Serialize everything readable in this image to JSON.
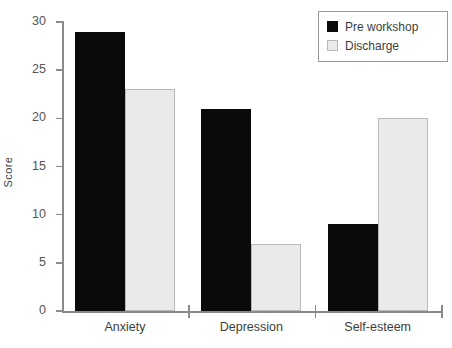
{
  "chart_data": {
    "type": "bar",
    "title": "",
    "xlabel": "",
    "ylabel": "Score",
    "categories": [
      "Anxiety",
      "Depression",
      "Self-esteem"
    ],
    "series": [
      {
        "name": "Pre workshop",
        "color": "#0a0a0a",
        "values": [
          29,
          21,
          9
        ]
      },
      {
        "name": "Discharge",
        "color": "#eaeaea",
        "values": [
          23,
          7,
          20
        ]
      }
    ],
    "ylim": [
      0,
      30
    ],
    "yticks": [
      0,
      5,
      10,
      15,
      20,
      25,
      30
    ],
    "ytick_labels": [
      "0",
      "5",
      "10",
      "15",
      "20",
      "25",
      "30"
    ],
    "grid": false,
    "legend_position": "top-right"
  },
  "legend": {
    "entries": [
      {
        "label": "Pre workshop",
        "swatch": "dark"
      },
      {
        "label": "Discharge",
        "swatch": "light"
      }
    ]
  },
  "axes": {
    "y_title": "Score"
  }
}
